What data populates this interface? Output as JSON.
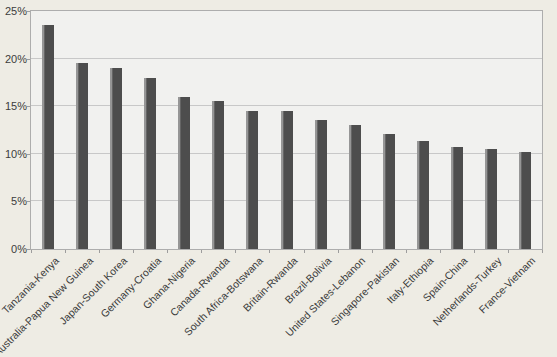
{
  "chart_data": {
    "type": "bar",
    "title": "",
    "xlabel": "",
    "ylabel": "",
    "categories": [
      "Tanzania-Kenya",
      "Australia-Papua New Guinea",
      "Japan-South Korea",
      "Germany-Croatia",
      "Ghana-Nigeria",
      "Canada-Rwanda",
      "South Africa-Botswana",
      "Britain-Rwanda",
      "Brazil-Bolivia",
      "United States-Lebanon",
      "Singapore-Pakistan",
      "Italy-Ethiopia",
      "Spain-China",
      "Netherlands-Turkey",
      "France-Vietnam"
    ],
    "values": [
      23.5,
      19.5,
      19.0,
      18.0,
      16.0,
      15.5,
      14.5,
      14.5,
      13.6,
      13.0,
      12.1,
      11.3,
      10.7,
      10.5,
      10.2
    ],
    "ylim": [
      0,
      25
    ],
    "ytick_interval": 5,
    "ytick_labels": [
      "0%",
      "5%",
      "10%",
      "15%",
      "20%",
      "25%"
    ],
    "grid": true,
    "legend": "none",
    "colors": {
      "bar": "#4d4d4d",
      "bar_highlight": "#969696",
      "plot_bg": "#f1f1ef",
      "outer_bg": "#eeece4",
      "gridline": "#c8c8c8",
      "plot_border": "#adadad",
      "tick": "#9d9d9d",
      "text": "#3c3c3c"
    }
  }
}
